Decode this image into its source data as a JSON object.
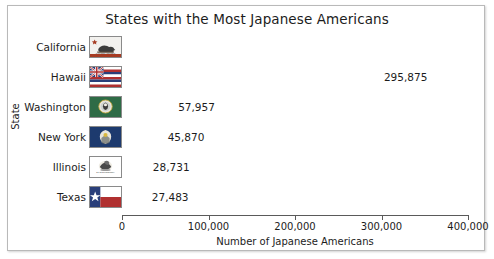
{
  "chart_data": {
    "type": "bar",
    "orientation": "horizontal",
    "title": "States with the Most Japanese Americans",
    "xlabel": "Number of Japanese Americans",
    "ylabel": "State",
    "categories": [
      "California",
      "Hawaii",
      "Washington",
      "New York",
      "Illinois",
      "Texas"
    ],
    "values": [
      395399,
      295875,
      57957,
      45870,
      28731,
      27483
    ],
    "value_labels": [
      "395,399",
      "295,875",
      "57,957",
      "45,870",
      "28,731",
      "27,483"
    ],
    "xlim": [
      0,
      400000
    ],
    "xticks": [
      0,
      100000,
      200000,
      300000,
      400000
    ],
    "xtick_labels": [
      "0",
      "100,000",
      "200,000",
      "300,000",
      "400,000"
    ],
    "grid": false,
    "legend": null,
    "bar_color": "#262626",
    "label_inside_flags": [
      true,
      false,
      false,
      false,
      false,
      false
    ],
    "icons": [
      {
        "name": "flag-california-icon",
        "state": "California"
      },
      {
        "name": "flag-hawaii-icon",
        "state": "Hawaii"
      },
      {
        "name": "flag-washington-icon",
        "state": "Washington"
      },
      {
        "name": "flag-new-york-icon",
        "state": "New York"
      },
      {
        "name": "flag-illinois-icon",
        "state": "Illinois"
      },
      {
        "name": "flag-texas-icon",
        "state": "Texas"
      }
    ]
  },
  "colors": {
    "bar": "#262626",
    "text": "#1c1c1c",
    "axis": "#5a5a5a",
    "frame": "#b9b9b9",
    "background": "#ffffff",
    "value_inside_text": "#ffffff"
  }
}
